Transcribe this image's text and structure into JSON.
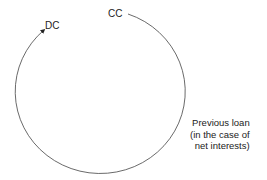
{
  "diagram": {
    "nodes": [
      {
        "id": "cc",
        "label": "CC"
      },
      {
        "id": "dc",
        "label": "DC"
      }
    ],
    "annotation": {
      "lines": [
        "Previous loan",
        "(in the case of",
        "net interests)"
      ]
    },
    "edges": [
      {
        "from": "cc",
        "to": "dc",
        "style": "clockwise arc with arrowhead at DC"
      }
    ],
    "colors": {
      "line": "#333333",
      "text": "#222222",
      "background": "#ffffff"
    }
  }
}
